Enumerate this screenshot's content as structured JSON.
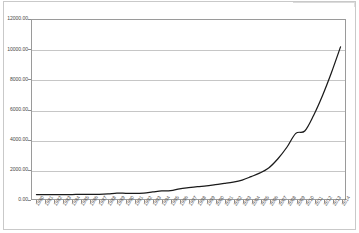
{
  "chart_data": {
    "type": "line",
    "title": "",
    "subtitle": "",
    "xlabel": "",
    "ylabel": "",
    "grid": true,
    "legend": false,
    "legend_position": "none",
    "xlim": [
      1980,
      2014
    ],
    "ylim": [
      0,
      12000
    ],
    "y_ticks": [
      0,
      2000,
      4000,
      6000,
      8000,
      10000,
      12000
    ],
    "y_tick_labels": [
      "0.00",
      "2000.00",
      "4000.00",
      "6000.00",
      "8000.00",
      "10000.00",
      "12000.00"
    ],
    "line_color": "#1a1a1a",
    "grid_color": "#c6c6c6",
    "axis_color": "#9a9a9a",
    "categories": [
      "1980",
      "1981",
      "1982",
      "1983",
      "1984",
      "1985",
      "1986",
      "1987",
      "1988",
      "1989",
      "1990",
      "1991",
      "1992",
      "1993",
      "1994",
      "1995",
      "1996",
      "1997",
      "1998",
      "1999",
      "2000",
      "2001",
      "2002",
      "2003",
      "2004",
      "2005",
      "2006",
      "2007",
      "2008",
      "2009",
      "2010",
      "2011",
      "2012",
      "2013",
      "2014"
    ],
    "x": [
      1980,
      1981,
      1982,
      1983,
      1984,
      1985,
      1986,
      1987,
      1988,
      1989,
      1990,
      1991,
      1992,
      1993,
      1994,
      1995,
      1996,
      1997,
      1998,
      1999,
      2000,
      2001,
      2002,
      2003,
      2004,
      2005,
      2006,
      2007,
      2008,
      2009,
      2010,
      2011,
      2012,
      2013,
      2014
    ],
    "values": [
      300,
      295,
      292,
      295,
      300,
      305,
      305,
      310,
      340,
      400,
      380,
      370,
      400,
      470,
      540,
      560,
      680,
      760,
      830,
      880,
      960,
      1040,
      1130,
      1270,
      1500,
      1750,
      2100,
      2700,
      3470,
      4400,
      4560,
      5620,
      6960,
      8500,
      10200
    ],
    "series": [
      {
        "name": "",
        "values": [
          300,
          295,
          292,
          295,
          300,
          305,
          305,
          310,
          340,
          400,
          380,
          370,
          400,
          470,
          540,
          560,
          680,
          760,
          830,
          880,
          960,
          1040,
          1130,
          1270,
          1500,
          1750,
          2100,
          2700,
          3470,
          4400,
          4560,
          5620,
          6960,
          8500,
          10200
        ]
      }
    ]
  }
}
